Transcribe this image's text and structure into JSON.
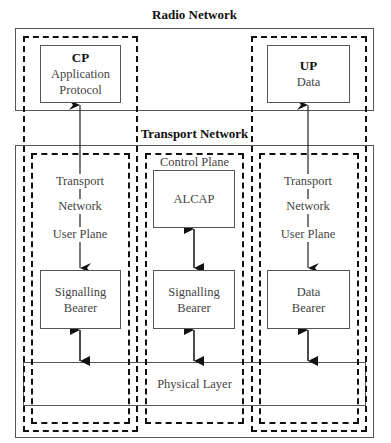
{
  "radio_network": {
    "title": "Radio Network",
    "cp": {
      "heading": "CP",
      "line1": "Application",
      "line2": "Protocol"
    },
    "up": {
      "heading": "UP",
      "line1": "Data"
    }
  },
  "transport_network": {
    "title": "Transport Network",
    "left_column": {
      "stack_labels": [
        "Transport",
        "Network",
        "User Plane"
      ],
      "bearer_line1": "Signalling",
      "bearer_line2": "Bearer"
    },
    "middle_column": {
      "title": "Control Plane",
      "alcap": "ALCAP",
      "bearer_line1": "Signalling",
      "bearer_line2": "Bearer"
    },
    "right_column": {
      "stack_labels": [
        "Transport",
        "Network",
        "User Plane"
      ],
      "bearer_line1": "Data",
      "bearer_line2": "Bearer"
    },
    "physical_layer": "Physical Layer"
  }
}
